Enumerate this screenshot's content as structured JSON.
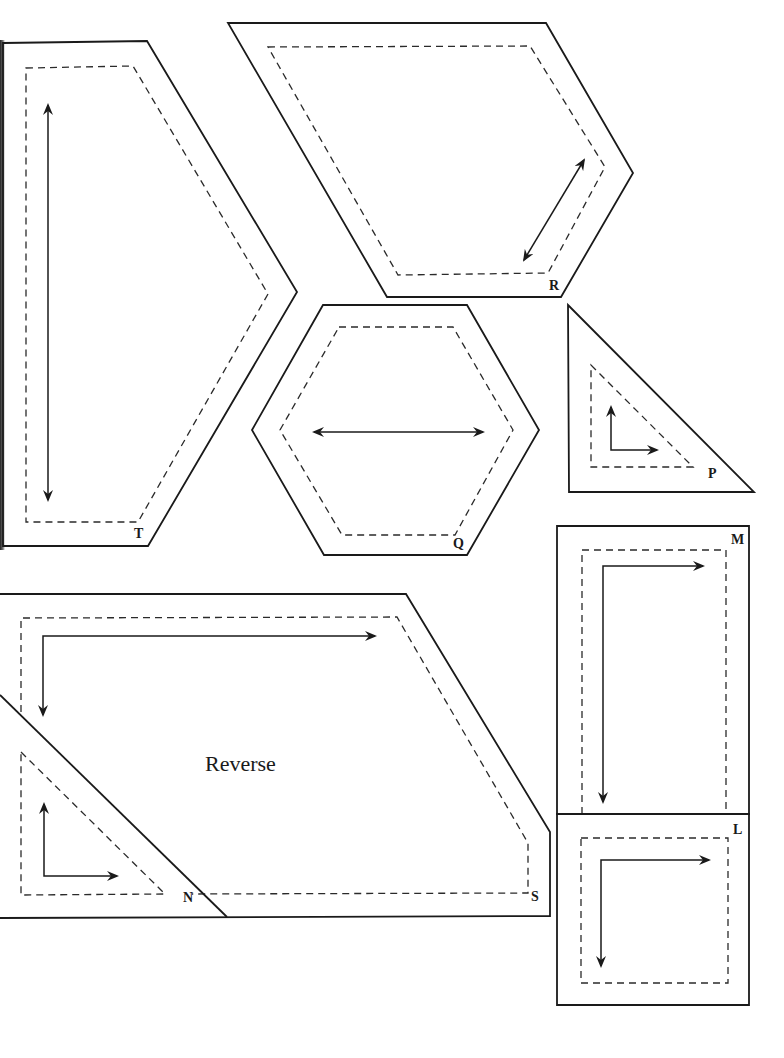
{
  "sheet": {
    "title": "Quilt template pieces",
    "colors": {
      "line": "#1a1a1a",
      "background": "#ffffff"
    }
  },
  "pieces": [
    {
      "id": "T",
      "label": "T",
      "shape": "pentagon (half-hexagon point)",
      "grainline": "vertical double arrow"
    },
    {
      "id": "R",
      "label": "R",
      "shape": "elongated hexagon / diamond",
      "grainline": "diagonal double arrow"
    },
    {
      "id": "Q",
      "label": "Q",
      "shape": "hexagon",
      "grainline": "horizontal double arrow"
    },
    {
      "id": "P",
      "label": "P",
      "shape": "right triangle",
      "grainline": "L-shaped arrows (up and right)"
    },
    {
      "id": "M",
      "label": "M",
      "shape": "rectangle",
      "grainline": "L-shaped arrows (right and down)"
    },
    {
      "id": "L",
      "label": "L",
      "shape": "square",
      "grainline": "L-shaped arrows (right and down)"
    },
    {
      "id": "S",
      "label": "S",
      "shape": "irregular pentagon",
      "grainline": "L-shaped arrows (right and down)",
      "note": "Reverse"
    },
    {
      "id": "N",
      "label": "N",
      "shape": "right triangle (overlapping S)",
      "grainline": "L-shaped arrows (up and right)"
    }
  ],
  "labels": {
    "T": "T",
    "R": "R",
    "Q": "Q",
    "P": "P",
    "M": "M",
    "L": "L",
    "S": "S",
    "N": "N",
    "reverse": "Reverse"
  },
  "legend": {
    "solid_line": "cutting line",
    "dashed_line": "seam line",
    "arrow": "grain line"
  }
}
